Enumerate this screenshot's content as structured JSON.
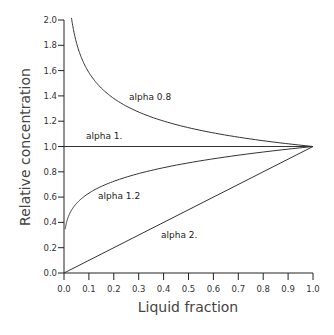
{
  "chart_data": {
    "type": "line",
    "title": "",
    "xlabel": "Liquid fraction",
    "ylabel": "Relative concentration",
    "xlim": [
      0.0,
      1.0
    ],
    "ylim": [
      0.0,
      2.0
    ],
    "grid": false,
    "legend_position": "inline labels",
    "x_ticks": [
      "0.0",
      "0.1",
      "0.2",
      "0.3",
      "0.4",
      "0.5",
      "0.6",
      "0.7",
      "0.8",
      "0.9",
      "1.0"
    ],
    "y_ticks": [
      "0.0",
      "0.2",
      "0.4",
      "0.6",
      "0.8",
      "1.0",
      "1.2",
      "1.4",
      "1.6",
      "1.8",
      "2.0"
    ],
    "x": [
      0.0,
      0.03,
      0.05,
      0.1,
      0.2,
      0.3,
      0.4,
      0.5,
      0.6,
      0.7,
      0.8,
      0.9,
      1.0
    ],
    "series": [
      {
        "name": "alpha 0.8",
        "exponent": -0.2,
        "x": [
          0.03,
          0.05,
          0.1,
          0.2,
          0.3,
          0.4,
          0.5,
          0.6,
          0.7,
          0.8,
          0.9,
          1.0
        ],
        "values": [
          1.95,
          1.82,
          1.58,
          1.38,
          1.27,
          1.2,
          1.15,
          1.11,
          1.07,
          1.05,
          1.02,
          1.0
        ]
      },
      {
        "name": "alpha 1.",
        "exponent": 0.0,
        "x": [
          0.0,
          1.0
        ],
        "values": [
          1.0,
          1.0
        ]
      },
      {
        "name": "alpha 1.2",
        "exponent": 0.2,
        "x": [
          0.005,
          0.01,
          0.05,
          0.1,
          0.2,
          0.3,
          0.4,
          0.5,
          0.6,
          0.7,
          0.8,
          0.9,
          1.0
        ],
        "values": [
          0.35,
          0.4,
          0.55,
          0.63,
          0.72,
          0.79,
          0.83,
          0.87,
          0.9,
          0.93,
          0.96,
          0.98,
          1.0
        ]
      },
      {
        "name": "alpha 2.",
        "exponent": 1.0,
        "x": [
          0.0,
          1.0
        ],
        "values": [
          0.0,
          1.0
        ]
      }
    ],
    "annotations": [
      {
        "text": "alpha 0.8",
        "x": 0.26,
        "y": 1.39
      },
      {
        "text": "alpha 1.",
        "x": 0.09,
        "y": 1.07
      },
      {
        "text": "alpha 1.2",
        "x": 0.14,
        "y": 0.6
      },
      {
        "text": "alpha 2.",
        "x": 0.39,
        "y": 0.3
      }
    ]
  },
  "labels": {
    "xlabel": "Liquid fraction",
    "ylabel": "Relative concentration",
    "alpha_08": "alpha 0.8",
    "alpha_1": "alpha 1.",
    "alpha_12": "alpha 1.2",
    "alpha_2": "alpha 2."
  }
}
